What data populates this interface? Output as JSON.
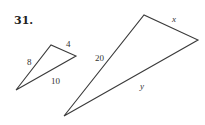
{
  "problem": {
    "number": "31."
  },
  "small_triangle": {
    "vertices": [
      [
        16,
        90
      ],
      [
        51,
        45
      ],
      [
        76,
        56
      ]
    ],
    "side_labels": {
      "left": "8",
      "top": "4",
      "bottom": "10"
    }
  },
  "large_triangle": {
    "vertices": [
      [
        64,
        116
      ],
      [
        144,
        15
      ],
      [
        198,
        40
      ]
    ],
    "side_labels": {
      "left": "20",
      "top": "x",
      "bottom": "y"
    }
  },
  "colors": {
    "line": "#3a3a3a",
    "text": "#222222",
    "background": "#ffffff"
  }
}
